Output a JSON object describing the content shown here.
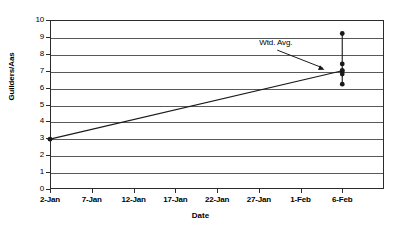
{
  "chart_data": {
    "type": "line",
    "title": "",
    "xlabel": "Date",
    "ylabel": "Guilders/Aas",
    "ylim": [
      0,
      10
    ],
    "ytick_values": [
      10,
      9,
      8,
      7,
      6,
      5,
      4,
      3,
      2,
      1,
      0
    ],
    "ytick_labels": [
      "10",
      "9",
      "8",
      "7",
      "6",
      "5",
      "4",
      "3",
      "2",
      "1",
      "0"
    ],
    "xtick_labels": [
      "2-Jan",
      "7-Jan",
      "12-Jan",
      "17-Jan",
      "22-Jan",
      "27-Jan",
      "1-Feb",
      "6-Feb"
    ],
    "xlim_days": [
      0,
      40
    ],
    "xtick_days": [
      0,
      5,
      10,
      15,
      20,
      25,
      30,
      35
    ],
    "grid": "horizontal",
    "legend": "none",
    "series": [
      {
        "name": "Wtd. Avg.",
        "type": "line",
        "x_days": [
          0,
          35
        ],
        "values": [
          2.95,
          7.0
        ],
        "marker": "filled-circle",
        "color": "#1a1a1a"
      },
      {
        "name": "Observations",
        "type": "scatter",
        "x_days": [
          35,
          35,
          35,
          35,
          35
        ],
        "values": [
          9.2,
          7.4,
          7.0,
          6.8,
          6.2
        ],
        "connector": "vertical-line",
        "marker": "filled-circle",
        "color": "#1a1a1a"
      }
    ],
    "annotations": [
      {
        "text": "Wtd. Avg.",
        "x_days": 26.5,
        "y": 8.1,
        "arrow_to_x_days": 33.0,
        "arrow_to_y": 7.05
      }
    ]
  },
  "colors": {
    "frame": "#2b2b2b",
    "gridline": "#595959",
    "series": "#1a1a1a",
    "background": "#ffffff"
  }
}
